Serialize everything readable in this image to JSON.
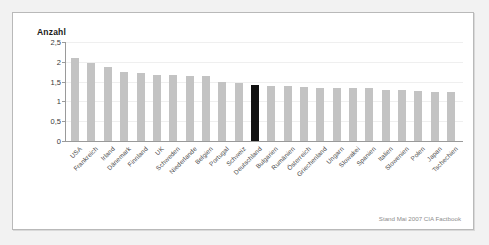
{
  "chart_data": {
    "type": "bar",
    "title": "",
    "ylabel": "Anzahl",
    "xlabel": "",
    "ylim": [
      0,
      2.5
    ],
    "grid": true,
    "legend": null,
    "ytick_labels": [
      "0",
      "0,5",
      "1",
      "1,5",
      "2",
      "2,5"
    ],
    "ytick_values": [
      0,
      0.5,
      1,
      1.5,
      2,
      2.5
    ],
    "categories": [
      "USA",
      "Frankreich",
      "Irland",
      "Dänemark",
      "Finnland",
      "UK",
      "Schweden",
      "Niederlande",
      "Belgien",
      "Portugal",
      "Schweiz",
      "Deutschland",
      "Bulgarien",
      "Rumänien",
      "Österreich",
      "Griechenland",
      "Ungarn",
      "Slowakei",
      "Spanien",
      "Italien",
      "Slowenien",
      "Polen",
      "Japan",
      "Tschechien"
    ],
    "values": [
      2.09,
      1.98,
      1.86,
      1.74,
      1.73,
      1.66,
      1.66,
      1.65,
      1.64,
      1.49,
      1.46,
      1.41,
      1.38,
      1.38,
      1.36,
      1.35,
      1.34,
      1.33,
      1.33,
      1.3,
      1.28,
      1.27,
      1.23,
      1.24
    ],
    "highlight_category": "Deutschland",
    "highlight_color": "#111111",
    "bar_color": "#c3c3c3",
    "annotation": "Stand Mai 2007 CIA Factbook"
  },
  "panel": {
    "background": "#ffffff",
    "border_color": "#b9b9b9",
    "page_background": "#f2f2f2"
  }
}
